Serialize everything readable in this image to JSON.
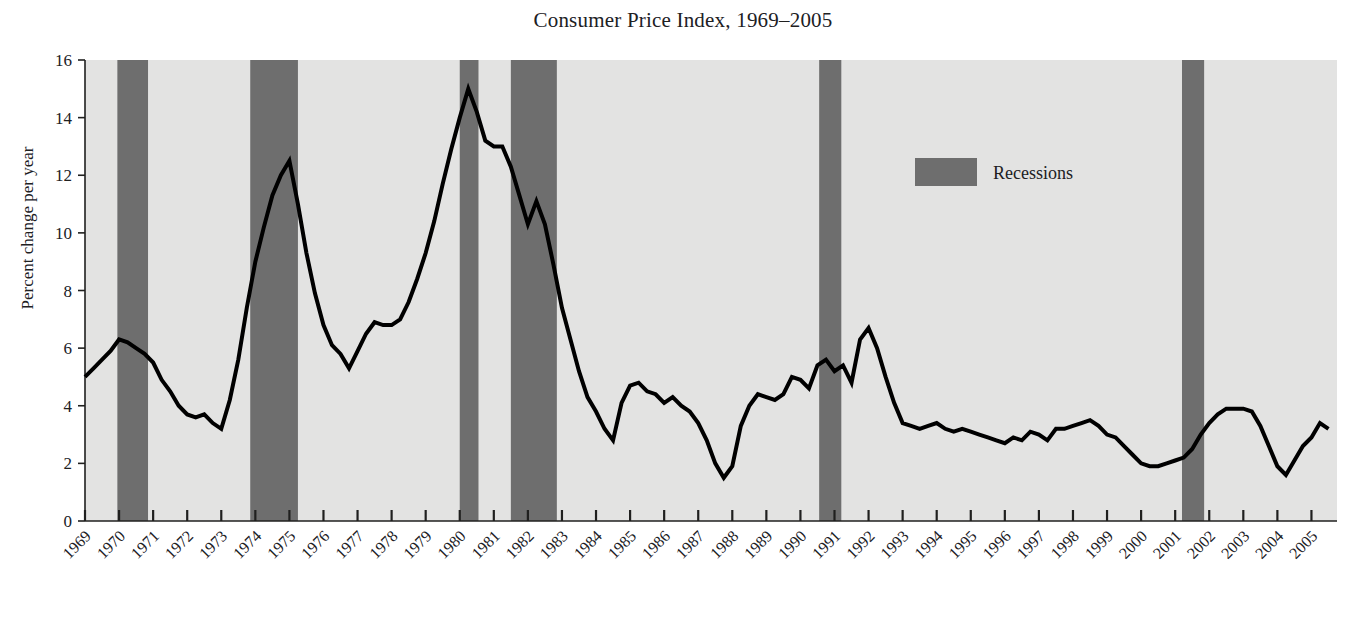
{
  "chart_data": {
    "type": "line",
    "title": "Consumer Price Index, 1969–2005",
    "xlabel": "",
    "ylabel": "Percent change per year",
    "ylim": [
      0,
      16
    ],
    "xlim": [
      1969,
      2005.75
    ],
    "y_ticks": [
      0,
      2,
      4,
      6,
      8,
      10,
      12,
      14,
      16
    ],
    "y_tick_labels": [
      "0",
      "2",
      "4",
      "6",
      "8",
      "10",
      "12",
      "14",
      "16"
    ],
    "x_ticks": [
      1969,
      1970,
      1971,
      1972,
      1973,
      1974,
      1975,
      1976,
      1977,
      1978,
      1979,
      1980,
      1981,
      1982,
      1983,
      1984,
      1985,
      1986,
      1987,
      1988,
      1989,
      1990,
      1991,
      1992,
      1993,
      1994,
      1995,
      1996,
      1997,
      1998,
      1999,
      2000,
      2001,
      2002,
      2003,
      2004,
      2005
    ],
    "x_tick_labels": [
      "1969",
      "1970",
      "1971",
      "1972",
      "1973",
      "1974",
      "1975",
      "1976",
      "1977",
      "1978",
      "1979",
      "1980",
      "1981",
      "1982",
      "1983",
      "1984",
      "1985",
      "1986",
      "1987",
      "1988",
      "1989",
      "1990",
      "1991",
      "1992",
      "1993",
      "1994",
      "1995",
      "1996",
      "1997",
      "1998",
      "1999",
      "2000",
      "2001",
      "2002",
      "2003",
      "2004",
      "2005"
    ],
    "grid": false,
    "plot_background_color": "#e3e3e2",
    "line_color": "#000000",
    "line_width": 4,
    "recession_band_color": "#6e6e6e",
    "legend": {
      "position": "upper-right-inside",
      "entries": [
        {
          "label": "Recessions",
          "type": "band",
          "color": "#6e6e6e"
        }
      ]
    },
    "recessions": [
      {
        "start": 1969.95,
        "end": 1970.85
      },
      {
        "start": 1973.85,
        "end": 1975.25
      },
      {
        "start": 1980.0,
        "end": 1980.55
      },
      {
        "start": 1981.5,
        "end": 1982.85
      },
      {
        "start": 1990.55,
        "end": 1991.2
      },
      {
        "start": 2001.2,
        "end": 2001.85
      }
    ],
    "series": [
      {
        "name": "CPI percent change per year",
        "x": [
          1969.0,
          1969.25,
          1969.5,
          1969.75,
          1970.0,
          1970.25,
          1970.5,
          1970.75,
          1971.0,
          1971.25,
          1971.5,
          1971.75,
          1972.0,
          1972.25,
          1972.5,
          1972.75,
          1973.0,
          1973.25,
          1973.5,
          1973.75,
          1974.0,
          1974.25,
          1974.5,
          1974.75,
          1975.0,
          1975.25,
          1975.5,
          1975.75,
          1976.0,
          1976.25,
          1976.5,
          1976.75,
          1977.0,
          1977.25,
          1977.5,
          1977.75,
          1978.0,
          1978.25,
          1978.5,
          1978.75,
          1979.0,
          1979.25,
          1979.5,
          1979.75,
          1980.0,
          1980.25,
          1980.5,
          1980.75,
          1981.0,
          1981.25,
          1981.5,
          1981.75,
          1982.0,
          1982.25,
          1982.5,
          1982.75,
          1983.0,
          1983.25,
          1983.5,
          1983.75,
          1984.0,
          1984.25,
          1984.5,
          1984.75,
          1985.0,
          1985.25,
          1985.5,
          1985.75,
          1986.0,
          1986.25,
          1986.5,
          1986.75,
          1987.0,
          1987.25,
          1987.5,
          1987.75,
          1988.0,
          1988.25,
          1988.5,
          1988.75,
          1989.0,
          1989.25,
          1989.5,
          1989.75,
          1990.0,
          1990.25,
          1990.5,
          1990.75,
          1991.0,
          1991.25,
          1991.5,
          1991.75,
          1992.0,
          1992.25,
          1992.5,
          1992.75,
          1993.0,
          1993.25,
          1993.5,
          1993.75,
          1994.0,
          1994.25,
          1994.5,
          1994.75,
          1995.0,
          1995.25,
          1995.5,
          1995.75,
          1996.0,
          1996.25,
          1996.5,
          1996.75,
          1997.0,
          1997.25,
          1997.5,
          1997.75,
          1998.0,
          1998.25,
          1998.5,
          1998.75,
          1999.0,
          1999.25,
          1999.5,
          1999.75,
          2000.0,
          2000.25,
          2000.5,
          2000.75,
          2001.0,
          2001.25,
          2001.5,
          2001.75,
          2002.0,
          2002.25,
          2002.5,
          2002.75,
          2003.0,
          2003.25,
          2003.5,
          2003.75,
          2004.0,
          2004.25,
          2004.5,
          2004.75,
          2005.0,
          2005.25,
          2005.5
        ],
        "y": [
          5.0,
          5.3,
          5.6,
          5.9,
          6.3,
          6.2,
          6.0,
          5.8,
          5.5,
          4.9,
          4.5,
          4.0,
          3.7,
          3.6,
          3.7,
          3.4,
          3.2,
          4.2,
          5.6,
          7.4,
          9.0,
          10.2,
          11.3,
          12.0,
          12.5,
          11.0,
          9.3,
          7.9,
          6.8,
          6.1,
          5.8,
          5.3,
          5.9,
          6.5,
          6.9,
          6.8,
          6.8,
          7.0,
          7.6,
          8.4,
          9.3,
          10.4,
          11.7,
          12.9,
          14.0,
          15.0,
          14.2,
          13.2,
          13.0,
          13.0,
          12.3,
          11.3,
          10.3,
          11.1,
          10.3,
          8.9,
          7.4,
          6.3,
          5.2,
          4.3,
          3.8,
          3.2,
          2.8,
          4.1,
          4.7,
          4.8,
          4.5,
          4.4,
          4.1,
          4.3,
          4.0,
          3.8,
          3.4,
          2.8,
          2.0,
          1.5,
          1.9,
          3.3,
          4.0,
          4.4,
          4.3,
          4.2,
          4.4,
          5.0,
          4.9,
          4.6,
          5.4,
          5.6,
          5.2,
          5.4,
          4.8,
          6.3,
          6.7,
          6.0,
          5.0,
          4.1,
          3.4,
          3.3,
          3.2,
          3.3,
          3.4,
          3.2,
          3.1,
          3.2,
          3.1,
          3.0,
          2.9,
          2.8,
          2.7,
          2.9,
          2.8,
          3.1,
          3.0,
          2.8,
          3.2,
          3.2,
          3.3,
          3.4,
          3.5,
          3.3,
          3.0,
          2.9,
          2.6,
          2.3,
          2.0,
          1.9,
          1.9,
          2.0,
          2.1,
          2.2,
          2.5,
          3.0,
          3.4,
          3.7,
          3.9,
          3.9,
          3.9,
          3.8,
          3.3,
          2.6,
          1.9,
          1.6,
          2.1,
          2.6,
          2.9,
          3.4,
          3.2
        ],
        "color": "#000000",
        "style": "solid"
      }
    ],
    "peaks": [
      {
        "year": 1970.0,
        "value": 6.3
      },
      {
        "year": 1975.0,
        "value": 12.5
      },
      {
        "year": 1980.25,
        "value": 15.0
      },
      {
        "year": 1981.0,
        "value": 13.0
      },
      {
        "year": 1982.25,
        "value": 11.1
      },
      {
        "year": 1986.75,
        "value": 1.5
      },
      {
        "year": 1990.75,
        "value": 6.7
      },
      {
        "year": 1998.25,
        "value": 1.9
      },
      {
        "year": 2002.25,
        "value": 1.6
      }
    ]
  }
}
